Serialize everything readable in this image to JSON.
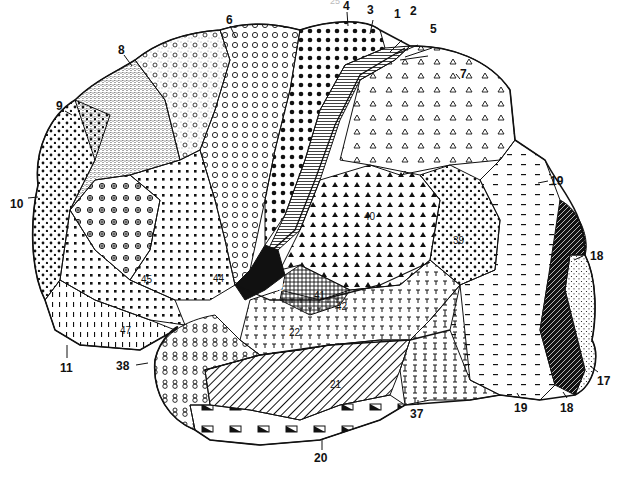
{
  "figure": {
    "page_number": "25",
    "areas": [
      {
        "id": "1",
        "pattern": "fine-lines"
      },
      {
        "id": "2",
        "pattern": "fine-lines"
      },
      {
        "id": "3",
        "pattern": "fine-lines"
      },
      {
        "id": "4",
        "pattern": "large-dots"
      },
      {
        "id": "5",
        "pattern": "triangles"
      },
      {
        "id": "6",
        "pattern": "circles"
      },
      {
        "id": "7",
        "pattern": "triangles"
      },
      {
        "id": "8",
        "pattern": "stipple-circles"
      },
      {
        "id": "9",
        "pattern": "dense-stipple"
      },
      {
        "id": "10",
        "pattern": "dots"
      },
      {
        "id": "11",
        "pattern": "vertical-ticks"
      },
      {
        "id": "17",
        "pattern": "fine-stipple"
      },
      {
        "id": "18",
        "pattern": "black-hatched"
      },
      {
        "id": "19",
        "pattern": "dashes"
      },
      {
        "id": "20",
        "pattern": "half-filled-boxes"
      },
      {
        "id": "21",
        "pattern": "diagonal-lines"
      },
      {
        "id": "22",
        "pattern": "t-marks"
      },
      {
        "id": "37",
        "pattern": "i-beams"
      },
      {
        "id": "38",
        "pattern": "eights"
      },
      {
        "id": "39",
        "pattern": "dots-clubs"
      },
      {
        "id": "40",
        "pattern": "filled-triangles"
      },
      {
        "id": "41",
        "pattern": "crosshatch"
      },
      {
        "id": "42",
        "pattern": "crosshatch"
      },
      {
        "id": "43",
        "pattern": "black"
      },
      {
        "id": "44",
        "pattern": "squares"
      },
      {
        "id": "45",
        "pattern": "circled-crosses"
      },
      {
        "id": "47",
        "pattern": "squares"
      }
    ],
    "labels": {
      "l1": "1",
      "l2": "2",
      "l3": "3",
      "l4": "4",
      "l5": "5",
      "l6": "6",
      "l7": "7",
      "l8": "8",
      "l9": "9",
      "l10": "10",
      "l11": "11",
      "l17": "17",
      "l18a": "18",
      "l18b": "18",
      "l19a": "19",
      "l19b": "19",
      "l20": "20",
      "l21": "21",
      "l22": "22",
      "l37": "37",
      "l38": "38",
      "l39": "39",
      "l40": "40",
      "l41": "41",
      "l42": "42",
      "l43": "43",
      "l44": "44",
      "l45": "45",
      "l47": "47"
    },
    "colors": {
      "ink": "#111111",
      "paper": "#ffffff"
    }
  }
}
